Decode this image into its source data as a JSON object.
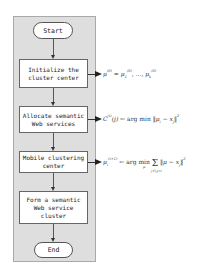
{
  "diagram": {
    "type": "flowchart",
    "nodes": {
      "start": "Start",
      "step1": "Initialize the\ncluster center",
      "step2": "Allocate semantic\nWeb services",
      "step3": "Mobile clustering\ncenter",
      "step4": "Form a semantic\nWeb service\ncluster",
      "end": "End"
    },
    "formulas": {
      "f1": "μ(0) = μ1(0), ..., μk(0)",
      "f2": "C(t)(j) ← arg min ||μi − xj||²",
      "f3": "μi(t+1) ← arg min_μ Σ_{j:C(j)=i} ||μ − xj||²"
    },
    "edges": [
      {
        "from": "start",
        "to": "step1"
      },
      {
        "from": "step1",
        "to": "step2"
      },
      {
        "from": "step2",
        "to": "step3"
      },
      {
        "from": "step3",
        "to": "step4"
      },
      {
        "from": "step4",
        "to": "end"
      },
      {
        "from": "step1",
        "to": "f1"
      },
      {
        "from": "step2",
        "to": "f2"
      },
      {
        "from": "step3",
        "to": "f3"
      }
    ],
    "colors": {
      "panel": "#dedede",
      "node_fill": "#ffffff",
      "stroke": "#555555"
    }
  }
}
